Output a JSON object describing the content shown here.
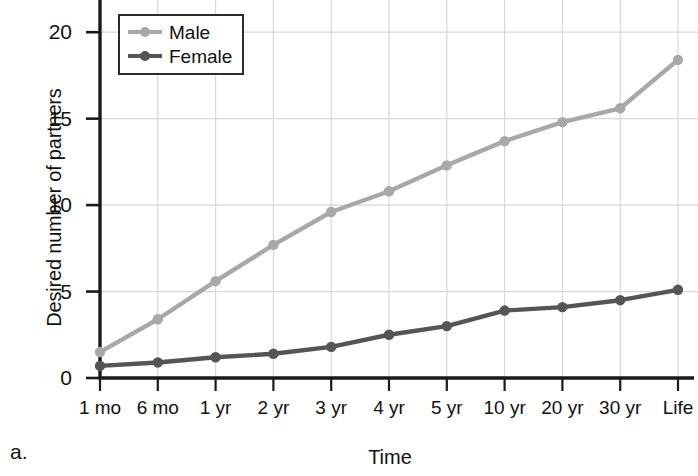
{
  "panel_letter": "a.",
  "legend": {
    "position": "upper-left-inside",
    "entries": [
      {
        "label": "Male",
        "color": "#a8a8a8"
      },
      {
        "label": "Female",
        "color": "#555555"
      }
    ]
  },
  "axes": {
    "y_ticks": [
      "0",
      "5",
      "10",
      "15",
      "20"
    ],
    "x_ticks": [
      "1 mo",
      "6 mo",
      "1 yr",
      "2 yr",
      "3 yr",
      "4 yr",
      "5 yr",
      "10 yr",
      "20 yr",
      "30 yr",
      "Life"
    ]
  },
  "colors": {
    "male": "#a8a8a8",
    "female": "#555555",
    "grid": "#d8d8d8",
    "axis": "#1a1a1a",
    "text": "#111111",
    "background": "#ffffff"
  },
  "chart_data": {
    "type": "line",
    "title": "",
    "subtitle": "",
    "xlabel": "Time",
    "ylabel": "Desired number of partners",
    "categories": [
      "1 mo",
      "6 mo",
      "1 yr",
      "2 yr",
      "3 yr",
      "4 yr",
      "5 yr",
      "10 yr",
      "20 yr",
      "30 yr",
      "Life"
    ],
    "series": [
      {
        "name": "Male",
        "color": "#a8a8a8",
        "values": [
          1.5,
          3.4,
          5.6,
          7.7,
          9.6,
          10.8,
          12.3,
          13.7,
          14.8,
          15.6,
          18.4
        ]
      },
      {
        "name": "Female",
        "color": "#555555",
        "values": [
          0.7,
          0.9,
          1.2,
          1.4,
          1.8,
          2.5,
          3.0,
          3.9,
          4.1,
          4.5,
          5.1
        ]
      }
    ],
    "ylim": [
      0,
      21.5
    ],
    "yticks": [
      0,
      5,
      10,
      15,
      20
    ],
    "grid": true,
    "legend_position": "upper left"
  }
}
